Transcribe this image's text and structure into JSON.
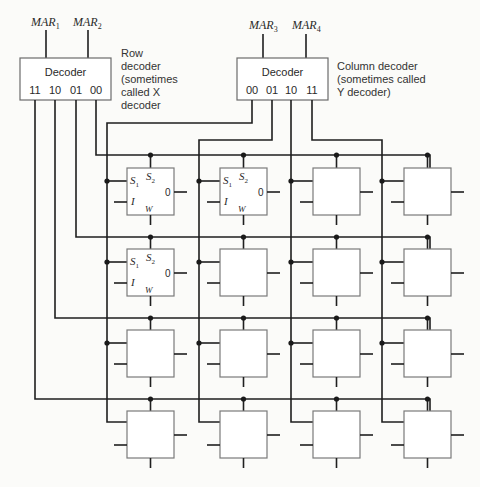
{
  "row_decoder": {
    "title": "Decoder",
    "inputs": [
      "MAR",
      "MAR"
    ],
    "input_subscripts": [
      "1",
      "2"
    ],
    "outputs": [
      "11",
      "10",
      "01",
      "00"
    ],
    "caption_lines": [
      "Row",
      "decoder",
      "(sometimes",
      "called X",
      "decoder"
    ]
  },
  "column_decoder": {
    "title": "Decoder",
    "inputs": [
      "MAR",
      "MAR"
    ],
    "input_subscripts": [
      "3",
      "4"
    ],
    "outputs": [
      "00",
      "01",
      "10",
      "11"
    ],
    "caption_lines": [
      "Column decoder",
      "(sometimes called",
      "Y decoder)"
    ]
  },
  "cell_labels": {
    "s1": "S",
    "s1_sub": "1",
    "s2": "S",
    "s2_sub": "2",
    "input": "I",
    "output": "0",
    "write": "W"
  },
  "grid": {
    "rows": 4,
    "columns": 4,
    "labeled_cells": [
      [
        0,
        0
      ],
      [
        0,
        1
      ],
      [
        1,
        0
      ]
    ]
  }
}
